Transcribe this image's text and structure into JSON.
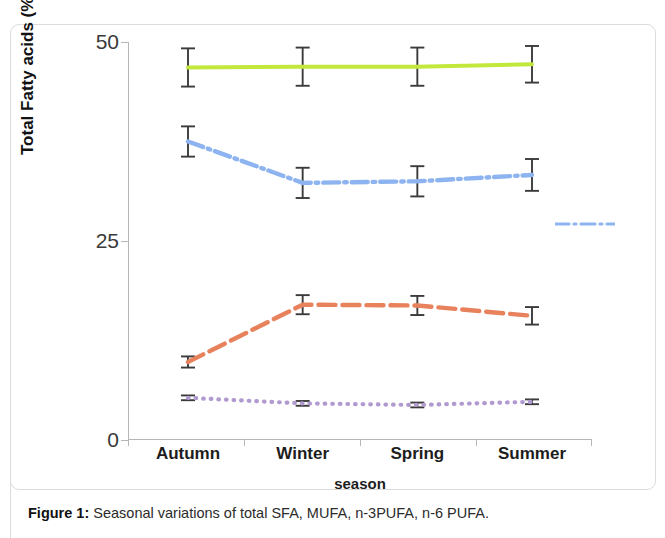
{
  "figure": {
    "caption_prefix": "Figure 1:",
    "caption_text": "Seasonal variations of total SFA, MUFA, n-3PUFA, n-6 PUFA."
  },
  "axes": {
    "y_title": "Total Fatty acids (%)",
    "x_title": "season",
    "y_ticks": [
      "50",
      "25",
      "0"
    ],
    "x_ticks": [
      "Autumn",
      "Winter",
      "Spring",
      "Summer"
    ]
  },
  "colors": {
    "sfa": "#c3e83c",
    "mufa": "#8db4f0",
    "n6pufa": "#e8825c",
    "n3pufa": "#b09ad0",
    "errorbar": "#3b3b3b",
    "axis": "#b6b6b6"
  },
  "chart_data": {
    "type": "line",
    "title": "Seasonal variations of total SFA, MUFA, n-3PUFA, n-6 PUFA.",
    "xlabel": "season",
    "ylabel": "Total Fatty acids (%)",
    "categories": [
      "Autumn",
      "Winter",
      "Spring",
      "Summer"
    ],
    "ylim": [
      0,
      50
    ],
    "yticks": [
      0,
      25,
      50
    ],
    "grid": false,
    "legend": "none",
    "series": [
      {
        "name": "SFA",
        "color": "#c3e83c",
        "style": "solid",
        "values": [
          46.8,
          46.9,
          46.9,
          47.2
        ],
        "errors": [
          2.4,
          2.4,
          2.4,
          2.3
        ]
      },
      {
        "name": "MUFA",
        "color": "#8db4f0",
        "style": "dash-dot",
        "values": [
          37.5,
          32.3,
          32.5,
          33.3
        ],
        "errors": [
          1.9,
          1.9,
          1.9,
          2.0
        ]
      },
      {
        "name": "n-6 PUFA",
        "color": "#e8825c",
        "style": "dashed",
        "values": [
          9.8,
          17.0,
          16.9,
          15.6
        ],
        "errors": [
          0.7,
          1.2,
          1.2,
          1.1
        ]
      },
      {
        "name": "n-3 PUFA",
        "color": "#b09ad0",
        "style": "dotted",
        "values": [
          5.3,
          4.6,
          4.4,
          4.8
        ],
        "errors": [
          0.3,
          0.3,
          0.3,
          0.3
        ]
      }
    ]
  }
}
